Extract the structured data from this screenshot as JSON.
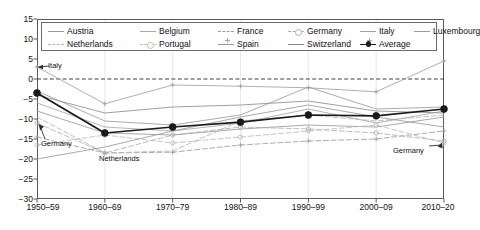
{
  "chart_data": {
    "type": "line",
    "title": "",
    "subtitle": "",
    "xlabel": "",
    "ylabel": "",
    "categories": [
      "1950–59",
      "1960–69",
      "1970–79",
      "1980–89",
      "1990–99",
      "2000–09",
      "2010–20"
    ],
    "ylim": [
      -30,
      15
    ],
    "yticks": [
      15,
      10,
      5,
      0,
      -5,
      -10,
      -15,
      -20,
      -25,
      -30
    ],
    "ytick_labels": [
      "15",
      "10",
      "5",
      "0",
      "−5",
      "−10",
      "−15",
      "−20",
      "−25",
      "−30"
    ],
    "grid": false,
    "zero_line": true,
    "legend_position": "top-inside",
    "series": [
      {
        "name": "Austria",
        "color": "#9a9a9a",
        "dash": "solid",
        "marker": "none",
        "values": [
          -8.0,
          -13.5,
          -14.0,
          -12.5,
          -11.5,
          -12.0,
          -9.5
        ]
      },
      {
        "name": "Belgium",
        "color": "#a8a8a8",
        "dash": "solid",
        "marker": "none",
        "values": [
          -6.0,
          -12.0,
          -13.0,
          -11.0,
          -7.5,
          -11.0,
          -8.0
        ]
      },
      {
        "name": "France",
        "color": "#9e9e9e",
        "dash": "dashed",
        "marker": "plus",
        "values": [
          -14.5,
          -18.5,
          -18.3,
          -16.5,
          -15.5,
          -15.0,
          -13.0
        ]
      },
      {
        "name": "Germany",
        "color": "#b0b0b0",
        "dash": "dashed",
        "marker": "circle-open",
        "values": [
          -11.0,
          -18.5,
          -14.0,
          -12.0,
          -12.5,
          -13.5,
          -15.5
        ]
      },
      {
        "name": "Italy",
        "color": "#a0a0a0",
        "dash": "solid",
        "marker": "plus",
        "values": [
          3.0,
          -6.2,
          -1.5,
          -1.8,
          -2.2,
          -3.2,
          4.5
        ]
      },
      {
        "name": "Luxembourg",
        "color": "#9c9c9c",
        "dash": "solid",
        "marker": "none",
        "values": [
          -3.0,
          -10.5,
          -11.5,
          -9.0,
          -2.0,
          -7.5,
          -7.0
        ]
      },
      {
        "name": "Netherlands",
        "color": "#b4b4b4",
        "dash": "dashed",
        "marker": "none",
        "values": [
          -9.5,
          -18.5,
          -18.0,
          -10.5,
          -9.0,
          -10.5,
          -9.0
        ]
      },
      {
        "name": "Portugal",
        "color": "#bcbcbc",
        "dash": "dashed",
        "marker": "circle-open",
        "values": [
          -16.5,
          -14.0,
          -16.0,
          -14.5,
          -13.0,
          -11.5,
          -16.0
        ]
      },
      {
        "name": "Spain",
        "color": "#9a9a9a",
        "dash": "solid",
        "marker": "none",
        "values": [
          -20.0,
          -17.0,
          -13.0,
          -9.5,
          -6.5,
          -9.5,
          -12.0
        ]
      },
      {
        "name": "Switzerland",
        "color": "#8e8e8e",
        "dash": "solid",
        "marker": "none",
        "values": [
          -4.0,
          -8.5,
          -7.0,
          -6.5,
          -5.5,
          -8.0,
          -8.5
        ]
      },
      {
        "name": "Average",
        "color": "#1a1a1a",
        "dash": "solid",
        "marker": "circle-fill",
        "values": [
          -3.5,
          -13.5,
          -12.0,
          -10.8,
          -9.0,
          -9.2,
          -7.5
        ]
      }
    ],
    "annotations": [
      {
        "text": "Italy",
        "x_value": 0,
        "y_value": 3.0,
        "label_x": 48,
        "label_y": 62,
        "arrow": "left"
      },
      {
        "text": "Germany",
        "x_value": 0,
        "y_value": -11.0,
        "label_x": 41,
        "label_y": 140,
        "arrow": "up-left"
      },
      {
        "text": "Netherlands",
        "x_value": 1,
        "y_value": -18.5,
        "label_x": 99,
        "label_y": 155,
        "arrow": "none"
      },
      {
        "text": "Germany",
        "x_value": 6,
        "y_value": -15.5,
        "label_x": 393,
        "label_y": 147,
        "arrow": "up-right"
      }
    ]
  },
  "legend": {
    "rows": [
      [
        "Austria",
        "Belgium",
        "France",
        "Germany",
        "Italy",
        "Luxembourg"
      ],
      [
        "Netherlands",
        "Portugal",
        "Spain",
        "Switzerland",
        "Average"
      ]
    ]
  }
}
